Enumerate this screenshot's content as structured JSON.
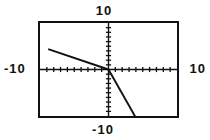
{
  "viewport": {
    "width": 210,
    "height": 140,
    "background": "#ffffff",
    "ink": "#111111"
  },
  "labels": {
    "ymax": "10",
    "ymin": "-10",
    "xmin": "-10",
    "xmax": "10"
  },
  "chart_data": {
    "type": "line",
    "title": "",
    "xlabel": "",
    "ylabel": "",
    "xlim": [
      -10,
      10
    ],
    "ylim": [
      -10,
      10
    ],
    "grid": false,
    "legend": false,
    "axes": {
      "x_axis_y": 0,
      "y_axis_x": 0,
      "tick_count_x": 20,
      "tick_count_y": 20,
      "tick_spacing": 1,
      "tick_style": "dotted-marks",
      "frame": "rectangular-box"
    },
    "tick_labels": {
      "x": [
        "-10",
        "10"
      ],
      "y": [
        "-10",
        "10"
      ]
    },
    "series": [
      {
        "name": "shallow-line",
        "color": "#111111",
        "slope": -0.5,
        "intercept": 0,
        "x": [
          -8.8,
          0
        ],
        "y": [
          4.4,
          0
        ],
        "segment": "left-of-origin"
      },
      {
        "name": "steep-line",
        "color": "#111111",
        "slope": -2.6,
        "intercept": 0,
        "x": [
          0,
          5.2
        ],
        "y": [
          0,
          -13.5
        ],
        "segment": "right-of-origin"
      }
    ],
    "annotations": [
      {
        "text": "Two line segments meeting at the origin",
        "visible": false
      }
    ]
  }
}
